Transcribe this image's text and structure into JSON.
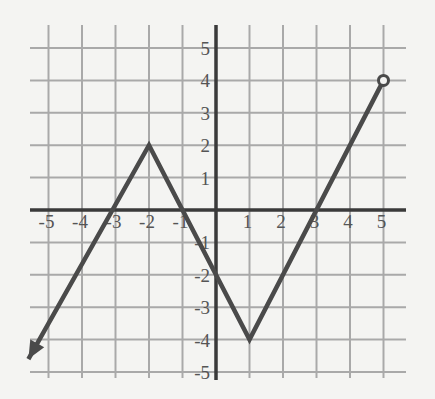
{
  "chart_data": {
    "type": "line",
    "title": "",
    "xlabel": "",
    "ylabel": "",
    "xlim": [
      -5,
      5
    ],
    "ylim": [
      -5,
      5
    ],
    "grid": true,
    "x_ticks": [
      -5,
      -4,
      -3,
      -2,
      -1,
      1,
      2,
      3,
      4,
      5
    ],
    "y_ticks": [
      5,
      4,
      3,
      2,
      1,
      -1,
      -2,
      -3,
      -4,
      -5
    ],
    "x_tick_labels": [
      "-5",
      "-4",
      "-3",
      "-2",
      "-1",
      "1",
      "2",
      "3",
      "4",
      "5"
    ],
    "y_tick_labels": [
      "5",
      "4",
      "3",
      "2",
      "1",
      "-1",
      "-2",
      "-3",
      "-4",
      "-5"
    ],
    "series": [
      {
        "name": "f(x)",
        "points": [
          [
            -5.6,
            -4.6
          ],
          [
            -2,
            2
          ],
          [
            1,
            -4
          ],
          [
            5,
            4
          ]
        ],
        "start_marker": "arrow",
        "end_marker": "open-circle"
      }
    ],
    "colors": {
      "line": "#4a4a4a",
      "grid": "#a9a9a9",
      "axis": "#3a3a3a",
      "background": "#f4f4f2"
    }
  }
}
